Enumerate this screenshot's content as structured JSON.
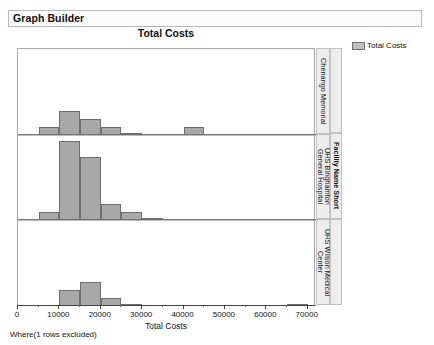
{
  "window": {
    "title": "Graph Builder"
  },
  "chart_title": "Total Costs",
  "legend": {
    "label": "Total Costs",
    "swatch_color": "#bfbfbf"
  },
  "footer": {
    "text": "Where(1 rows excluded)"
  },
  "facet_axis": {
    "title": "Facility Name Short"
  },
  "chart_data": {
    "type": "bar",
    "title": "Total Costs",
    "xlabel": "Total Costs",
    "ylabel": "",
    "xlim": [
      0,
      72000
    ],
    "grid": false,
    "legend_position": "top-right",
    "bin_width": 5000,
    "facet_by": "Facility Name Short",
    "xticks": [
      0,
      10000,
      20000,
      30000,
      40000,
      50000,
      60000,
      70000
    ],
    "xticklabels": [
      "0",
      "10000",
      "20000",
      "30000",
      "40000",
      "50000",
      "60000",
      "70000"
    ],
    "panels": [
      {
        "label": "Chenango Memorial",
        "ymax": 10,
        "bins": [
          {
            "x0": 5000,
            "x1": 10000,
            "count": 1
          },
          {
            "x0": 10000,
            "x1": 15000,
            "count": 3
          },
          {
            "x0": 15000,
            "x1": 20000,
            "count": 2
          },
          {
            "x0": 20000,
            "x1": 25000,
            "count": 1
          },
          {
            "x0": 25000,
            "x1": 30000,
            "count": 0
          },
          {
            "x0": 40000,
            "x1": 45000,
            "count": 1
          }
        ]
      },
      {
        "label": "UHS Binghamton\nGeneral Hospital",
        "ymax": 10,
        "bins": [
          {
            "x0": 5000,
            "x1": 10000,
            "count": 1
          },
          {
            "x0": 10000,
            "x1": 15000,
            "count": 10
          },
          {
            "x0": 15000,
            "x1": 20000,
            "count": 8
          },
          {
            "x0": 20000,
            "x1": 25000,
            "count": 2
          },
          {
            "x0": 25000,
            "x1": 30000,
            "count": 1
          },
          {
            "x0": 30000,
            "x1": 35000,
            "count": 0
          }
        ]
      },
      {
        "label": "UHS Wilson Medical\nCenter",
        "ymax": 10,
        "bins": [
          {
            "x0": 10000,
            "x1": 15000,
            "count": 2
          },
          {
            "x0": 15000,
            "x1": 20000,
            "count": 3
          },
          {
            "x0": 20000,
            "x1": 25000,
            "count": 1
          },
          {
            "x0": 25000,
            "x1": 30000,
            "count": 0
          },
          {
            "x0": 65000,
            "x1": 70000,
            "count": 0
          }
        ]
      }
    ]
  }
}
